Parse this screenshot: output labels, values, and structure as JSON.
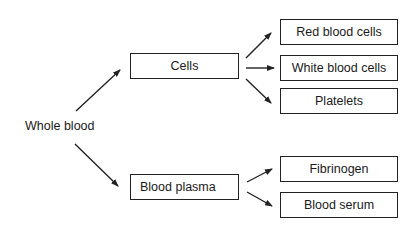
{
  "diagram": {
    "root": "Whole blood",
    "level1": {
      "cells": "Cells",
      "plasma": "Blood plasma"
    },
    "cells_children": [
      "Red blood cells",
      "White blood cells",
      "Platelets"
    ],
    "plasma_children": [
      "Fibrinogen",
      "Blood serum"
    ]
  }
}
